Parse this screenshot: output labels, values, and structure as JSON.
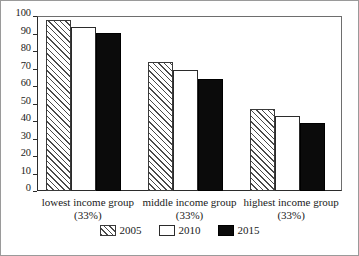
{
  "chart_data": {
    "type": "bar",
    "title": "",
    "xlabel": "",
    "ylabel": "",
    "ylim": [
      0,
      100
    ],
    "ytick_step": 10,
    "grid": false,
    "legend_position": "bottom",
    "categories": [
      "lowest income group (33%)",
      "middle income group (33%)",
      "highest income group (33%)"
    ],
    "category_lines": [
      {
        "line1": "lowest income group",
        "line2": "(33%)"
      },
      {
        "line1": "middle income group",
        "line2": "(33%)"
      },
      {
        "line1": "highest income group",
        "line2": "(33%)"
      }
    ],
    "yticks": [
      "0",
      "10",
      "20",
      "30",
      "40",
      "50",
      "60",
      "70",
      "80",
      "90",
      "100"
    ],
    "ytick_values": [
      0,
      10,
      20,
      30,
      40,
      50,
      60,
      70,
      80,
      90,
      100
    ],
    "series": [
      {
        "name": "2005",
        "values": [
          97.5,
          73.5,
          47
        ],
        "style": "hatched",
        "color": "#ffffff"
      },
      {
        "name": "2010",
        "values": [
          94,
          69,
          43
        ],
        "style": "outline",
        "color": "#ffffff"
      },
      {
        "name": "2015",
        "values": [
          90.5,
          64,
          39
        ],
        "style": "filled",
        "color": "#0b0b0b"
      }
    ]
  },
  "legend": {
    "items": [
      {
        "label": "2005",
        "swatch": "hatched-swatch"
      },
      {
        "label": "2010",
        "swatch": "white-swatch"
      },
      {
        "label": "2015",
        "swatch": "black-swatch"
      }
    ]
  },
  "colors": {
    "axis": "#2b2b2b",
    "frame": "#9a9a9a",
    "hatch": "#4a4a4a",
    "fill_black": "#0b0b0b",
    "fill_white": "#ffffff",
    "background": "#ffffff"
  }
}
